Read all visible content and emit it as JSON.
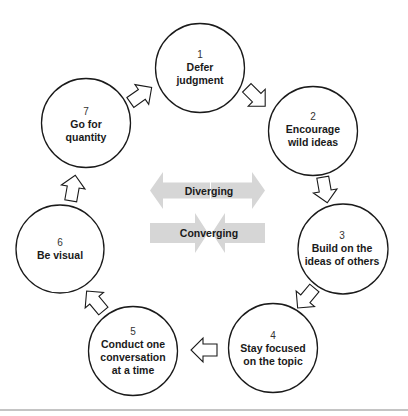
{
  "diagram": {
    "steps": [
      {
        "number": "1",
        "lines": [
          "Defer",
          "judgment"
        ]
      },
      {
        "number": "2",
        "lines": [
          "Encourage",
          "wild ideas"
        ]
      },
      {
        "number": "3",
        "lines": [
          "Build on the",
          "ideas of others"
        ]
      },
      {
        "number": "4",
        "lines": [
          "Stay focused",
          "on the topic"
        ]
      },
      {
        "number": "5",
        "lines": [
          "Conduct one",
          "conversation",
          "at a time"
        ]
      },
      {
        "number": "6",
        "lines": [
          "Be visual"
        ]
      },
      {
        "number": "7",
        "lines": [
          "Go for",
          "quantity"
        ]
      }
    ],
    "center": {
      "diverging_label": "Diverging",
      "converging_label": "Converging"
    },
    "colors": {
      "circle_stroke": "#1a1a1a",
      "center_arrow_fill": "#d6d6d6",
      "text": "#1a1a1a",
      "footer_rule": "#8a8a8a"
    }
  }
}
